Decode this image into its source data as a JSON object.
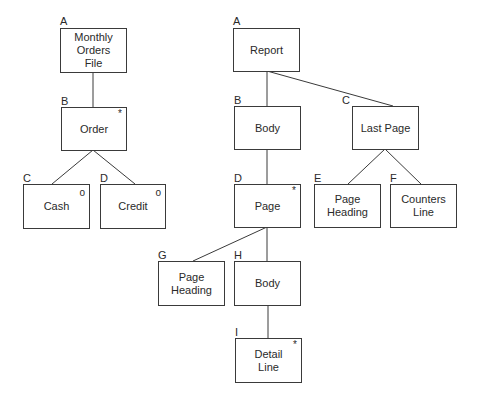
{
  "diagram": {
    "type": "jackson-structure-diagram",
    "line_color": "#3a3a3a",
    "left_tree": {
      "nodes": {
        "A": {
          "letter": "A",
          "text": "Monthly\nOrders\nFile",
          "marker": ""
        },
        "B": {
          "letter": "B",
          "text": "Order",
          "marker": "*"
        },
        "C": {
          "letter": "C",
          "text": "Cash",
          "marker": "o"
        },
        "D": {
          "letter": "D",
          "text": "Credit",
          "marker": "o"
        }
      }
    },
    "right_tree": {
      "nodes": {
        "A": {
          "letter": "A",
          "text": "Report",
          "marker": ""
        },
        "B": {
          "letter": "B",
          "text": "Body",
          "marker": ""
        },
        "C": {
          "letter": "C",
          "text": "Last Page",
          "marker": ""
        },
        "D": {
          "letter": "D",
          "text": "Page",
          "marker": "*"
        },
        "E": {
          "letter": "E",
          "text": "Page\nHeading",
          "marker": ""
        },
        "F": {
          "letter": "F",
          "text": "Counters\nLine",
          "marker": ""
        },
        "G": {
          "letter": "G",
          "text": "Page\nHeading",
          "marker": ""
        },
        "H": {
          "letter": "H",
          "text": "Body",
          "marker": ""
        },
        "I": {
          "letter": "I",
          "text": "Detail\nLine",
          "marker": "*"
        }
      }
    }
  }
}
